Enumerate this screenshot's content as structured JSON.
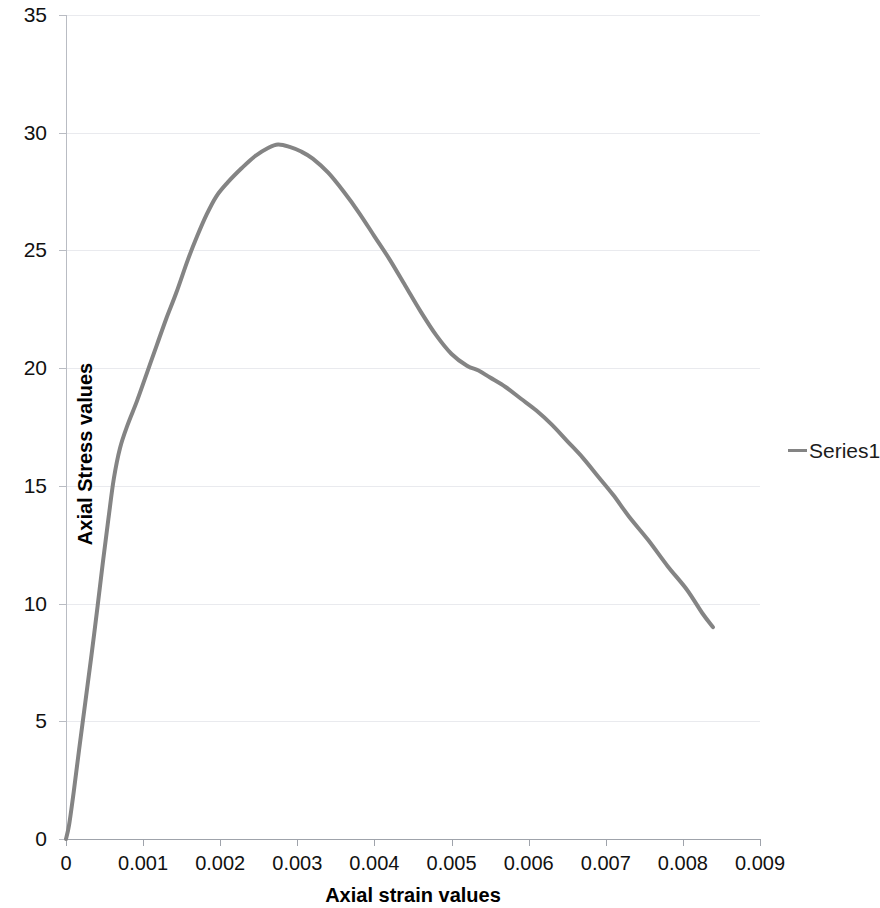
{
  "chart_data": {
    "type": "line",
    "title": "",
    "xlabel": "Axial strain values",
    "ylabel": "Axial Stress values",
    "xlim": [
      0,
      0.009
    ],
    "ylim": [
      0,
      35
    ],
    "grid": true,
    "legend_position": "right",
    "x_ticks": [
      "0",
      "0.001",
      "0.002",
      "0.003",
      "0.004",
      "0.005",
      "0.006",
      "0.007",
      "0.008",
      "0.009"
    ],
    "x_tick_values": [
      0,
      0.001,
      0.002,
      0.003,
      0.004,
      0.005,
      0.006,
      0.007,
      0.008,
      0.009
    ],
    "y_ticks": [
      "0",
      "5",
      "10",
      "15",
      "20",
      "25",
      "30",
      "35"
    ],
    "y_tick_values": [
      0,
      5,
      10,
      15,
      20,
      25,
      30,
      35
    ],
    "series": [
      {
        "name": "Series1",
        "color": "#848484",
        "line_width": 4,
        "x": [
          0.0,
          4e-05,
          0.0001,
          0.00017,
          0.00025,
          0.00033,
          0.00041,
          0.00048,
          0.00055,
          0.00062,
          0.0007,
          0.0008,
          0.00092,
          0.00105,
          0.00118,
          0.0013,
          0.00143,
          0.00158,
          0.0017,
          0.00182,
          0.00195,
          0.0021,
          0.00228,
          0.00245,
          0.00262,
          0.00275,
          0.0029,
          0.00305,
          0.0032,
          0.0034,
          0.0036,
          0.0038,
          0.004,
          0.0042,
          0.0044,
          0.0046,
          0.0048,
          0.005,
          0.0052,
          0.00535,
          0.0055,
          0.0057,
          0.0059,
          0.0061,
          0.0063,
          0.0065,
          0.0067,
          0.0069,
          0.0071,
          0.0073,
          0.00755,
          0.0078,
          0.00805,
          0.00825,
          0.00839
        ],
        "y": [
          0.0,
          0.6,
          2.0,
          3.8,
          5.8,
          7.8,
          9.9,
          11.8,
          13.6,
          15.3,
          16.6,
          17.6,
          18.6,
          19.8,
          21.0,
          22.1,
          23.2,
          24.6,
          25.6,
          26.5,
          27.3,
          27.9,
          28.5,
          29.0,
          29.35,
          29.5,
          29.4,
          29.2,
          28.9,
          28.3,
          27.5,
          26.6,
          25.6,
          24.6,
          23.5,
          22.4,
          21.4,
          20.6,
          20.1,
          19.9,
          19.6,
          19.2,
          18.7,
          18.2,
          17.6,
          16.9,
          16.2,
          15.4,
          14.6,
          13.7,
          12.7,
          11.6,
          10.6,
          9.6,
          9.0
        ],
        "peak": {
          "x": 0.00275,
          "y": 29.5
        },
        "end_point": {
          "x": 0.00839,
          "y": 9.0
        },
        "start_point": {
          "x": 0,
          "y": 0
        }
      }
    ]
  },
  "legend": {
    "entries": [
      {
        "label": "Series1",
        "color": "#848484",
        "marker": "line-swatch"
      }
    ]
  },
  "axes": {
    "y_title": "Axial Stress values",
    "x_title": "Axial strain values"
  }
}
